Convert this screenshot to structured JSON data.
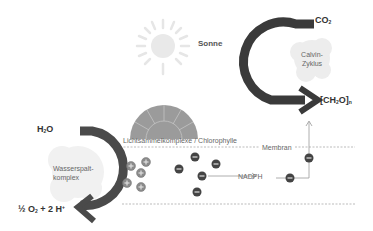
{
  "diagram": {
    "sun": {
      "label": "Sonne"
    },
    "light_harvesting": {
      "label": "Lichtsammelkomplexe / Chlorophylle"
    },
    "membrane": {
      "label": "Membran"
    },
    "water_splitting": {
      "label_line1": "Wasserspalt-",
      "label_line2": "komplex",
      "input": {
        "main": "H",
        "sub": "2",
        "tail": "O"
      },
      "output": {
        "pre": "½ O",
        "sub": "2",
        "mid": " + 2 H",
        "sup": "+"
      }
    },
    "calvin_cycle": {
      "label_line1": "Calvin-",
      "label_line2": "Zyklus",
      "input": {
        "main": "CO",
        "sub": "2"
      },
      "output": {
        "pre": "[CH",
        "sub": "2",
        "mid": "O]",
        "sub2": "n"
      }
    },
    "nadph": {
      "label": "NADPH"
    },
    "charges": {
      "positive_symbol": "+",
      "negative_symbol": "−"
    },
    "colors": {
      "arrow": "#3a3a3a",
      "dome": "#9a9a9a",
      "sun": "#e8e8e8",
      "blob": "#ececec",
      "membrane_dash": "#aaaaaa"
    }
  }
}
